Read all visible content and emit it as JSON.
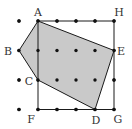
{
  "diagram": {
    "type": "geometry-grid",
    "colors": {
      "background": "#ffffff",
      "fill": "#c9c9c9",
      "stroke": "#1a1a1a",
      "dot": "#111111",
      "label": "#333333"
    },
    "grid": {
      "columns_x": [
        19,
        38,
        57,
        76,
        95,
        114
      ],
      "rows_y": [
        21,
        50.5,
        80,
        109.5
      ],
      "dot_radius": 1.7
    },
    "points": {
      "A": {
        "x": 38,
        "y": 21,
        "label": "A",
        "lx": 38,
        "ly": 16
      },
      "H": {
        "x": 114,
        "y": 21,
        "label": "H",
        "lx": 119,
        "ly": 16
      },
      "B": {
        "x": 19,
        "y": 50.5,
        "label": "B",
        "lx": 8,
        "ly": 55
      },
      "E": {
        "x": 114,
        "y": 50.5,
        "label": "E",
        "lx": 121,
        "ly": 55
      },
      "C": {
        "x": 38,
        "y": 80,
        "label": "C",
        "lx": 29,
        "ly": 85
      },
      "F": {
        "x": 38,
        "y": 109.5,
        "label": "F",
        "lx": 31,
        "ly": 123
      },
      "D": {
        "x": 95,
        "y": 109.5,
        "label": "D",
        "lx": 96,
        "ly": 124
      },
      "G": {
        "x": 114,
        "y": 109.5,
        "label": "G",
        "lx": 118,
        "ly": 123
      }
    },
    "shaded_polygon": [
      "A",
      "E",
      "D",
      "C",
      "B"
    ],
    "rectangle": [
      "A",
      "H",
      "G",
      "F"
    ]
  }
}
